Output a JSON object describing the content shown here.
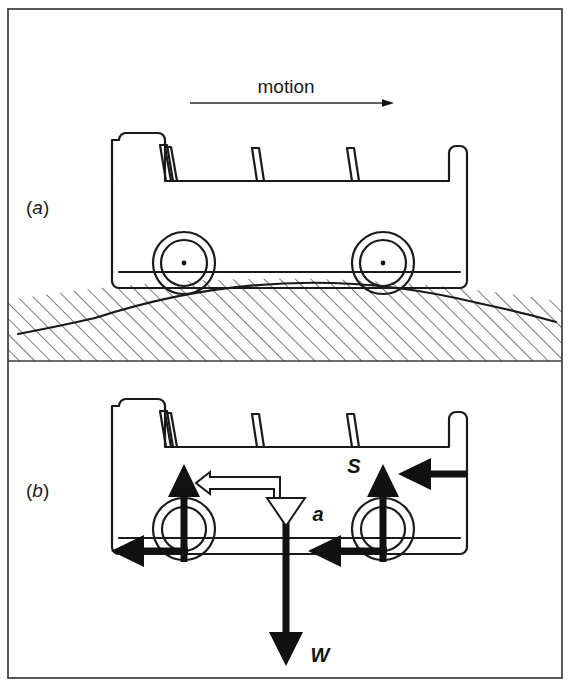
{
  "figure": {
    "kind": "physics-free-body-diagram",
    "background_color": "#ffffff",
    "ink_color": "#111111",
    "frame": {
      "outer_border": true,
      "divider": "horizontal line separating panel (a) from panel (b)"
    }
  },
  "panels": [
    {
      "id": "a",
      "label": "(a)",
      "label_letter": "a",
      "caption": "",
      "annotations": {
        "motion": {
          "text": "motion",
          "arrow_direction": "right",
          "arrow_style": "thin-line-with-small-solid-head"
        }
      },
      "scene": {
        "vehicle": "open-top bus, side view, two wheels",
        "wheel_count": 2,
        "wheel_style": "double-circle-with-centre-dot",
        "seat_backs": 4,
        "ground": "convex (crest) curved surface with 45-degree hatching below"
      }
    },
    {
      "id": "b",
      "label": "(b)",
      "label_letter": "b",
      "caption": "",
      "scene": {
        "vehicle": "open-top bus, side view, two wheels",
        "wheel_count": 2,
        "wheel_style": "double-circle",
        "seat_backs": 4,
        "ground": "not drawn"
      },
      "forces": [
        {
          "symbol": "S",
          "name": "normal-reaction-front-wheel",
          "direction": "up",
          "style": "solid-black",
          "labelled": false,
          "at": "front (left) wheel"
        },
        {
          "symbol": "S",
          "name": "normal-reaction-rear-wheel",
          "direction": "up",
          "style": "solid-black",
          "labelled": true,
          "at": "rear (right) wheel"
        },
        {
          "symbol": "",
          "name": "friction-front-wheel",
          "direction": "left",
          "style": "solid-black",
          "labelled": false,
          "at": "front (left) wheel contact"
        },
        {
          "symbol": "",
          "name": "friction-rear-wheel",
          "direction": "left",
          "style": "solid-black",
          "labelled": false,
          "at": "rear (right) wheel contact"
        },
        {
          "symbol": "",
          "name": "applied-force-rear",
          "direction": "left",
          "style": "solid-black",
          "labelled": false,
          "at": "rear body panel"
        },
        {
          "symbol": "W",
          "name": "weight",
          "direction": "down",
          "style": "solid-black",
          "labelled": true,
          "at": "centre of gravity"
        },
        {
          "symbol": "a",
          "name": "acceleration",
          "direction": "down (with leftward elbow branch)",
          "style": "hollow-outline",
          "labelled": true,
          "at": "centre of gravity"
        }
      ],
      "labels": {
        "S": "S",
        "W": "W",
        "a": "a"
      }
    }
  ]
}
